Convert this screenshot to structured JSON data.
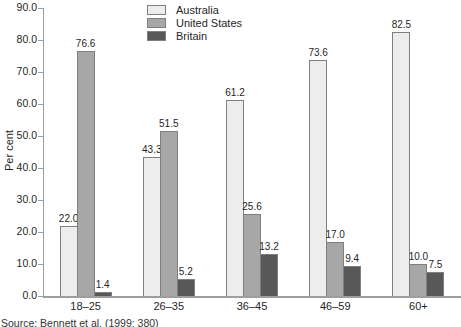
{
  "source": "Source: Bennett et al. (1999: 380)",
  "chart_data": {
    "type": "bar",
    "title": "",
    "categories": [
      "18–25",
      "26–35",
      "36–45",
      "46–59",
      "60+"
    ],
    "series": [
      {
        "name": "Australia",
        "color": "#ededed",
        "values": [
          22.0,
          43.3,
          61.2,
          73.6,
          82.5
        ]
      },
      {
        "name": "United States",
        "color": "#a7a7a7",
        "values": [
          76.6,
          51.5,
          25.6,
          17.0,
          10.0
        ]
      },
      {
        "name": "Britain",
        "color": "#585858",
        "values": [
          1.4,
          5.2,
          13.2,
          9.4,
          7.5
        ]
      }
    ],
    "xlabel": "",
    "ylabel": "Per cent",
    "ylim": [
      0,
      90
    ],
    "ytick_step": 10,
    "ytick_format_decimals": 1,
    "value_labels": true,
    "grid": false,
    "legend_position": "top-center",
    "bar_border_color": "#7f7f7f",
    "axis_color": "#9e9e9e"
  }
}
